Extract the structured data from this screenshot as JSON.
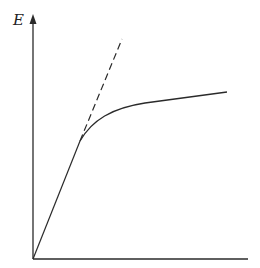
{
  "diagram": {
    "y_axis_label": "E",
    "x_axis_label": "",
    "colors": {
      "stroke": "#2a2a2a",
      "background": "#ffffff"
    },
    "elements": [
      {
        "id": "y-axis",
        "type": "arrow-axis"
      },
      {
        "id": "x-axis",
        "type": "axis"
      },
      {
        "id": "linear-segment",
        "type": "line",
        "style": "solid"
      },
      {
        "id": "tangent-extension",
        "type": "line",
        "style": "dashed"
      },
      {
        "id": "saturation-curve",
        "type": "curve",
        "style": "solid"
      }
    ]
  }
}
